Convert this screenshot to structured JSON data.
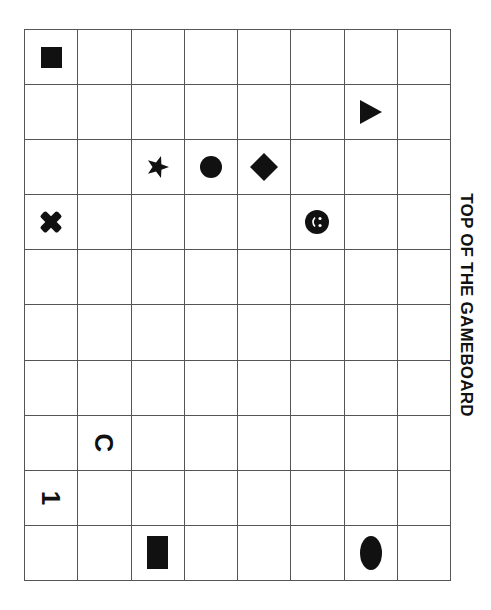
{
  "board": {
    "columns": 8,
    "rows": 10,
    "label": "TOP OF THE GAMEBOARD",
    "line_color": "#555555",
    "piece_color": "#111111",
    "pieces": [
      {
        "row": 1,
        "col": 1,
        "shape": "square",
        "name": "square-piece"
      },
      {
        "row": 2,
        "col": 7,
        "shape": "triangle",
        "name": "triangle-piece"
      },
      {
        "row": 3,
        "col": 3,
        "shape": "star",
        "name": "star-piece"
      },
      {
        "row": 3,
        "col": 4,
        "shape": "circle",
        "name": "circle-piece"
      },
      {
        "row": 3,
        "col": 5,
        "shape": "diamond",
        "name": "diamond-piece"
      },
      {
        "row": 4,
        "col": 1,
        "shape": "cross",
        "name": "x-piece"
      },
      {
        "row": 4,
        "col": 6,
        "shape": "smiley",
        "name": "smiley-piece"
      },
      {
        "row": 8,
        "col": 2,
        "shape": "letter",
        "text": "C",
        "name": "letter-c-piece"
      },
      {
        "row": 9,
        "col": 1,
        "shape": "letter",
        "text": "1",
        "name": "number-1-piece"
      },
      {
        "row": 10,
        "col": 3,
        "shape": "rect",
        "name": "rectangle-piece"
      },
      {
        "row": 10,
        "col": 7,
        "shape": "ellipse",
        "name": "oval-piece"
      }
    ],
    "letters": {
      "c": "C",
      "one": "1"
    }
  }
}
